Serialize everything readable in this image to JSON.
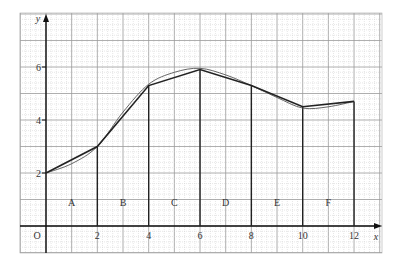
{
  "chart_data": {
    "type": "line",
    "title": "",
    "xlabel": "x",
    "ylabel": "y",
    "origin_label": "O",
    "x_ticks": [
      "2",
      "4",
      "6",
      "8",
      "10",
      "12"
    ],
    "y_ticks": [
      "2",
      "4",
      "6"
    ],
    "xlim": [
      -1,
      13
    ],
    "ylim": [
      -1,
      8
    ],
    "grid": true,
    "series": [
      {
        "name": "trapezium chords",
        "style": "straight segments",
        "x": [
          0,
          2,
          4,
          6,
          8,
          10,
          12
        ],
        "y": [
          2.0,
          3.0,
          5.3,
          5.9,
          5.3,
          4.5,
          4.7
        ]
      },
      {
        "name": "curve",
        "style": "smooth",
        "x": [
          0,
          1,
          2,
          3,
          4,
          5,
          6,
          7,
          8,
          9,
          10,
          11,
          12
        ],
        "y": [
          2.0,
          2.35,
          3.0,
          4.3,
          5.35,
          5.8,
          5.95,
          5.7,
          5.3,
          4.85,
          4.45,
          4.5,
          4.7
        ]
      }
    ],
    "vertical_lines_x": [
      2,
      4,
      6,
      8,
      10,
      12
    ],
    "regions": [
      {
        "label": "A",
        "x": 1
      },
      {
        "label": "B",
        "x": 3
      },
      {
        "label": "C",
        "x": 5
      },
      {
        "label": "D",
        "x": 7
      },
      {
        "label": "E",
        "x": 9
      },
      {
        "label": "F",
        "x": 11
      }
    ],
    "region_label_y": 0.9
  }
}
